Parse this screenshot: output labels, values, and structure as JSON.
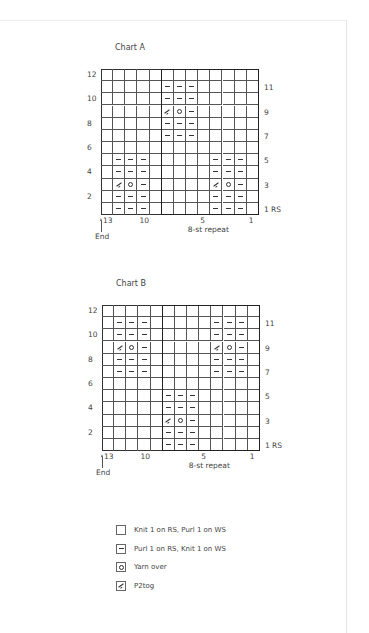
{
  "charts": [
    {
      "title": "Chart A",
      "left": 101,
      "top": 69,
      "cell_w": 12.15,
      "cell_h": 12.17,
      "cols": 13,
      "rows": 12,
      "left_row_labels": [
        "12",
        "10",
        "8",
        "6",
        "4",
        "2"
      ],
      "right_row_labels": [
        "11",
        "9",
        "7",
        "5",
        "3",
        "1 RS"
      ],
      "col_labels": [
        {
          "text": "13",
          "col": 13
        },
        {
          "text": "10",
          "col": 10
        },
        {
          "text": "5",
          "col": 5
        },
        {
          "text": "1",
          "col": 1
        }
      ],
      "repeat_label": "8-st repeat",
      "repeat_cols": [
        1,
        8
      ],
      "end_label": "End",
      "grid": [
        [
          "k",
          "k",
          "k",
          "k",
          "k",
          "k",
          "k",
          "k",
          "k",
          "k",
          "k",
          "k",
          "k"
        ],
        [
          "k",
          "k",
          "k",
          "k",
          "k",
          "p",
          "p",
          "p",
          "k",
          "k",
          "k",
          "k",
          "k"
        ],
        [
          "k",
          "k",
          "k",
          "k",
          "k",
          "p",
          "p",
          "p",
          "k",
          "k",
          "k",
          "k",
          "k"
        ],
        [
          "k",
          "k",
          "k",
          "k",
          "k",
          "t",
          "o",
          "p",
          "k",
          "k",
          "k",
          "k",
          "k"
        ],
        [
          "k",
          "k",
          "k",
          "k",
          "k",
          "p",
          "p",
          "p",
          "k",
          "k",
          "k",
          "k",
          "k"
        ],
        [
          "k",
          "k",
          "k",
          "k",
          "k",
          "p",
          "p",
          "p",
          "k",
          "k",
          "k",
          "k",
          "k"
        ],
        [
          "k",
          "k",
          "k",
          "k",
          "k",
          "k",
          "k",
          "k",
          "k",
          "k",
          "k",
          "k",
          "k"
        ],
        [
          "k",
          "p",
          "p",
          "p",
          "k",
          "k",
          "k",
          "k",
          "k",
          "p",
          "p",
          "p",
          "k"
        ],
        [
          "k",
          "p",
          "p",
          "p",
          "k",
          "k",
          "k",
          "k",
          "k",
          "p",
          "p",
          "p",
          "k"
        ],
        [
          "k",
          "t",
          "o",
          "p",
          "k",
          "k",
          "k",
          "k",
          "k",
          "t",
          "o",
          "p",
          "k"
        ],
        [
          "k",
          "p",
          "p",
          "p",
          "k",
          "k",
          "k",
          "k",
          "k",
          "p",
          "p",
          "p",
          "k"
        ],
        [
          "k",
          "p",
          "p",
          "p",
          "k",
          "k",
          "k",
          "k",
          "k",
          "p",
          "p",
          "p",
          "k"
        ]
      ]
    },
    {
      "title": "Chart B",
      "left": 102,
      "top": 305,
      "cell_w": 12.15,
      "cell_h": 12.17,
      "cols": 13,
      "rows": 12,
      "left_row_labels": [
        "12",
        "10",
        "8",
        "6",
        "4",
        "2"
      ],
      "right_row_labels": [
        "11",
        "9",
        "7",
        "5",
        "3",
        "1 RS"
      ],
      "col_labels": [
        {
          "text": "13",
          "col": 13
        },
        {
          "text": "10",
          "col": 10
        },
        {
          "text": "5",
          "col": 5
        },
        {
          "text": "1",
          "col": 1
        }
      ],
      "repeat_label": "8-st repeat",
      "repeat_cols": [
        1,
        8
      ],
      "end_label": "End",
      "grid": [
        [
          "k",
          "k",
          "k",
          "k",
          "k",
          "k",
          "k",
          "k",
          "k",
          "k",
          "k",
          "k",
          "k"
        ],
        [
          "k",
          "p",
          "p",
          "p",
          "k",
          "k",
          "k",
          "k",
          "k",
          "p",
          "p",
          "p",
          "k"
        ],
        [
          "k",
          "p",
          "p",
          "p",
          "k",
          "k",
          "k",
          "k",
          "k",
          "p",
          "p",
          "p",
          "k"
        ],
        [
          "k",
          "t",
          "o",
          "p",
          "k",
          "k",
          "k",
          "k",
          "k",
          "t",
          "o",
          "p",
          "k"
        ],
        [
          "k",
          "p",
          "p",
          "p",
          "k",
          "k",
          "k",
          "k",
          "k",
          "p",
          "p",
          "p",
          "k"
        ],
        [
          "k",
          "p",
          "p",
          "p",
          "k",
          "k",
          "k",
          "k",
          "k",
          "p",
          "p",
          "p",
          "k"
        ],
        [
          "k",
          "k",
          "k",
          "k",
          "k",
          "k",
          "k",
          "k",
          "k",
          "k",
          "k",
          "k",
          "k"
        ],
        [
          "k",
          "k",
          "k",
          "k",
          "k",
          "p",
          "p",
          "p",
          "k",
          "k",
          "k",
          "k",
          "k"
        ],
        [
          "k",
          "k",
          "k",
          "k",
          "k",
          "p",
          "p",
          "p",
          "k",
          "k",
          "k",
          "k",
          "k"
        ],
        [
          "k",
          "k",
          "k",
          "k",
          "k",
          "t",
          "o",
          "p",
          "k",
          "k",
          "k",
          "k",
          "k"
        ],
        [
          "k",
          "k",
          "k",
          "k",
          "k",
          "p",
          "p",
          "p",
          "k",
          "k",
          "k",
          "k",
          "k"
        ],
        [
          "k",
          "k",
          "k",
          "k",
          "k",
          "p",
          "p",
          "p",
          "k",
          "k",
          "k",
          "k",
          "k"
        ]
      ]
    }
  ],
  "legend": [
    {
      "symbol": "k",
      "icon": "blank-square-icon",
      "label": "Knit 1 on RS, Purl 1 on WS"
    },
    {
      "symbol": "p",
      "icon": "dash-icon",
      "label": "Purl 1 on RS, Knit 1 on WS"
    },
    {
      "symbol": "o",
      "icon": "circle-icon",
      "label": "Yarn over"
    },
    {
      "symbol": "t",
      "icon": "slash-icon",
      "label": "P2tog"
    }
  ]
}
